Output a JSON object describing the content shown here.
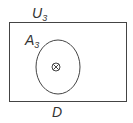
{
  "diagram": {
    "universe_label": "U",
    "universe_subscript": "3",
    "set_label": "A",
    "set_subscript": "3",
    "domain_label": "D",
    "center_symbol": "circle-times",
    "stroke_color": "#444444"
  }
}
